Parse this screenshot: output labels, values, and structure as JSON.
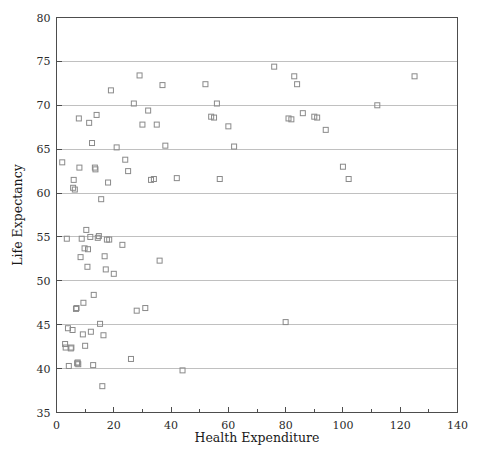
{
  "chart_data": {
    "type": "scatter",
    "title": "",
    "xlabel": "Health Expenditure",
    "ylabel": "Life Expectancy",
    "xlim": [
      0,
      140
    ],
    "ylim": [
      35,
      80
    ],
    "xticks": [
      0,
      20,
      40,
      60,
      80,
      100,
      120,
      140
    ],
    "xtick_labels": [
      "0",
      "20",
      "40",
      "60",
      "80",
      "100",
      "120",
      "140"
    ],
    "x_minor_ticks": [
      10,
      30,
      50,
      70,
      90,
      110,
      130
    ],
    "yticks": [
      35,
      40,
      45,
      50,
      55,
      60,
      65,
      70,
      75,
      80
    ],
    "ytick_labels": [
      "35",
      "40",
      "45",
      "50",
      "55",
      "60",
      "65",
      "70",
      "75",
      "80"
    ],
    "grid": "horizontal",
    "grid_color": "#b9b9b9",
    "marker": "open-square",
    "marker_color": "#8a8a8a",
    "legend": "none",
    "points": [
      [
        2.0,
        63.5
      ],
      [
        3.0,
        42.8
      ],
      [
        3.2,
        42.4
      ],
      [
        3.6,
        54.8
      ],
      [
        4.0,
        44.6
      ],
      [
        4.3,
        40.3
      ],
      [
        5.0,
        42.3
      ],
      [
        5.2,
        42.4
      ],
      [
        5.6,
        44.4
      ],
      [
        5.8,
        60.6
      ],
      [
        6.0,
        61.5
      ],
      [
        6.4,
        60.4
      ],
      [
        6.8,
        46.8
      ],
      [
        7.0,
        46.9
      ],
      [
        7.2,
        40.6
      ],
      [
        7.4,
        40.7
      ],
      [
        7.6,
        40.5
      ],
      [
        7.8,
        68.5
      ],
      [
        8.0,
        62.9
      ],
      [
        8.4,
        52.7
      ],
      [
        8.8,
        54.8
      ],
      [
        9.2,
        43.9
      ],
      [
        9.4,
        47.5
      ],
      [
        9.8,
        53.7
      ],
      [
        10.0,
        42.6
      ],
      [
        10.4,
        55.8
      ],
      [
        10.8,
        51.6
      ],
      [
        11.0,
        53.6
      ],
      [
        11.4,
        68.0
      ],
      [
        11.8,
        55.0
      ],
      [
        12.0,
        44.2
      ],
      [
        12.4,
        65.7
      ],
      [
        12.8,
        40.4
      ],
      [
        13.0,
        48.4
      ],
      [
        13.4,
        62.9
      ],
      [
        13.6,
        62.7
      ],
      [
        14.0,
        68.9
      ],
      [
        14.4,
        54.9
      ],
      [
        14.8,
        55.1
      ],
      [
        15.2,
        45.1
      ],
      [
        15.6,
        59.3
      ],
      [
        16.0,
        38.0
      ],
      [
        16.4,
        43.8
      ],
      [
        16.8,
        52.8
      ],
      [
        17.2,
        51.3
      ],
      [
        17.6,
        54.7
      ],
      [
        18.0,
        61.2
      ],
      [
        18.4,
        54.7
      ],
      [
        19.0,
        71.7
      ],
      [
        20.0,
        50.8
      ],
      [
        21.0,
        65.2
      ],
      [
        23.0,
        54.1
      ],
      [
        24.0,
        63.8
      ],
      [
        25.0,
        62.5
      ],
      [
        26.0,
        41.1
      ],
      [
        27.0,
        70.2
      ],
      [
        28.0,
        46.6
      ],
      [
        29.0,
        73.4
      ],
      [
        30.0,
        67.8
      ],
      [
        31.0,
        46.9
      ],
      [
        32.0,
        69.4
      ],
      [
        33.0,
        61.5
      ],
      [
        34.0,
        61.6
      ],
      [
        35.0,
        67.8
      ],
      [
        36.0,
        52.3
      ],
      [
        37.0,
        72.3
      ],
      [
        38.0,
        65.4
      ],
      [
        42.0,
        61.7
      ],
      [
        44.0,
        39.8
      ],
      [
        52.0,
        72.4
      ],
      [
        54.0,
        68.7
      ],
      [
        55.0,
        68.6
      ],
      [
        56.0,
        70.2
      ],
      [
        57.0,
        61.6
      ],
      [
        60.0,
        67.6
      ],
      [
        62.0,
        65.3
      ],
      [
        76.0,
        74.4
      ],
      [
        80.0,
        45.3
      ],
      [
        81.0,
        68.5
      ],
      [
        82.0,
        68.4
      ],
      [
        83.0,
        73.3
      ],
      [
        84.0,
        72.4
      ],
      [
        86.0,
        69.1
      ],
      [
        90.0,
        68.7
      ],
      [
        91.0,
        68.6
      ],
      [
        94.0,
        67.2
      ],
      [
        100.0,
        63.0
      ],
      [
        102.0,
        61.6
      ],
      [
        112.0,
        70.0
      ],
      [
        125.0,
        73.3
      ]
    ]
  }
}
